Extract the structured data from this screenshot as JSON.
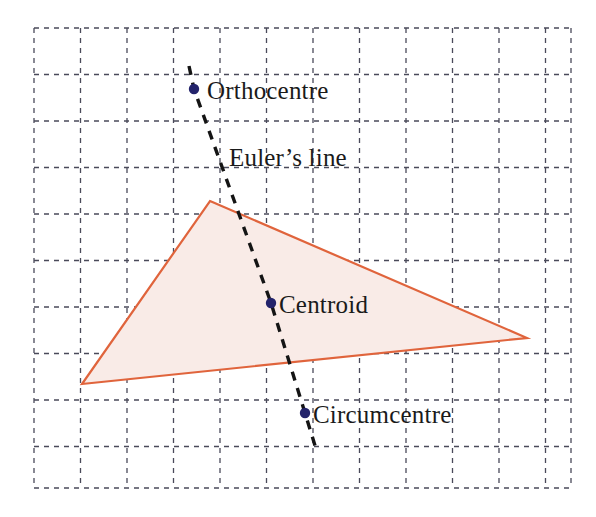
{
  "figure": {
    "background_color": "#ffffff",
    "width": 596,
    "height": 517
  },
  "grid": {
    "name": "dashed-graph-paper-grid",
    "line_color": "#4a4a5a",
    "line_style": "dashed",
    "dash_pattern": "5 5",
    "line_width": 1.3,
    "cell_size": 46.5,
    "origin_x": 34,
    "origin_y": 28,
    "columns": 12,
    "rows": 10,
    "x_lines": [
      34,
      80.5,
      127,
      173.5,
      220,
      266.5,
      313,
      359.5,
      406,
      452.5,
      499,
      545.5,
      571
    ],
    "y_lines": [
      28,
      74.5,
      121,
      167.5,
      214,
      260.5,
      307,
      353.5,
      400,
      446.5,
      488
    ]
  },
  "triangle": {
    "name": "shaded-triangle",
    "fill_color": "#f9ebe7",
    "stroke_color": "#e0643c",
    "stroke_width": 2.2,
    "vertices": [
      {
        "label": "apex",
        "x": 210,
        "y": 201
      },
      {
        "label": "right",
        "x": 527,
        "y": 338
      },
      {
        "label": "left",
        "x": 82,
        "y": 384
      }
    ]
  },
  "euler_line": {
    "name": "euler-line",
    "label": "Euler’s line",
    "label_x": 229,
    "label_y": 145,
    "stroke_color": "#141414",
    "stroke_width": 3.4,
    "line_style": "dashed",
    "dash_pattern": "9 8",
    "start": {
      "x": 189,
      "y": 66
    },
    "end": {
      "x": 317,
      "y": 452
    }
  },
  "points": [
    {
      "id": "orthocentre",
      "label": "Orthocentre",
      "x": 194,
      "y": 89,
      "label_x": 207,
      "label_y": 78,
      "color": "#23236b",
      "radius": 5.2
    },
    {
      "id": "centroid",
      "label": "Centroid",
      "x": 271,
      "y": 303,
      "label_x": 279,
      "label_y": 292,
      "color": "#23236b",
      "radius": 5.2
    },
    {
      "id": "circumcentre",
      "label": "Circumcentre",
      "x": 305,
      "y": 413,
      "label_x": 313,
      "label_y": 402,
      "color": "#23236b",
      "radius": 5.2
    }
  ],
  "chart_data": {
    "type": "scatter",
    "xlabel": "",
    "ylabel": "",
    "grid": true,
    "legend": "none",
    "annotations": [
      "Orthocentre",
      "Euler’s line",
      "Centroid",
      "Circumcentre"
    ],
    "series": [
      {
        "name": "Triangle vertices",
        "type": "polygon",
        "x": [
          210,
          527,
          82
        ],
        "y": [
          201,
          338,
          384
        ]
      },
      {
        "name": "Euler line centres",
        "type": "scatter",
        "x": [
          194,
          271,
          305
        ],
        "y": [
          89,
          303,
          413
        ],
        "labels": [
          "Orthocentre",
          "Centroid",
          "Circumcentre"
        ]
      },
      {
        "name": "Euler line",
        "type": "line",
        "x": [
          189,
          317
        ],
        "y": [
          66,
          452
        ]
      }
    ]
  }
}
